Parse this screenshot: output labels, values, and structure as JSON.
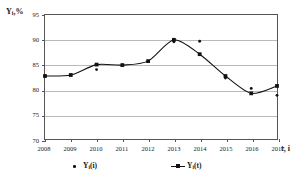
{
  "chart_data": {
    "type": "line",
    "title": "",
    "subtitle": "",
    "xlabel": "t, i",
    "ylabel": "Yᵢ,%",
    "ylabel_parts": {
      "base": "Y",
      "sub": "i",
      "suffix": ",%"
    },
    "xlabel_parts": {
      "base": "t, i"
    },
    "grid": true,
    "legend_position": "bottom",
    "x": [
      "2008",
      "2009",
      "2010",
      "2011",
      "2012",
      "2013",
      "2014",
      "2015",
      "2016",
      "2017"
    ],
    "categories": [
      "2008",
      "2009",
      "2010",
      "2011",
      "2012",
      "2013",
      "2014",
      "2015",
      "2016",
      "2017"
    ],
    "xlim": [
      2008,
      2017
    ],
    "ylim": [
      70,
      95
    ],
    "ytick_labels": [
      "95",
      "90",
      "85",
      "80",
      "75",
      "70"
    ],
    "yticks": [
      95,
      90,
      85,
      80,
      75,
      70
    ],
    "xtick_labels": [
      "2008",
      "2009",
      "2010",
      "2011",
      "2012",
      "2013",
      "2014",
      "2015",
      "2016",
      "2017"
    ],
    "series": [
      {
        "name": "Yᵢ(i)",
        "name_parts": {
          "base": "Y",
          "sub": "i",
          "suffix": "(i)"
        },
        "style": "scatter",
        "marker": "dot",
        "color": "#111111",
        "values": [
          82.7,
          82.9,
          84.0,
          84.9,
          85.6,
          89.6,
          89.7,
          82.3,
          80.2,
          78.8
        ]
      },
      {
        "name": "Yᵢ(t)",
        "name_parts": {
          "base": "Y",
          "sub": "i",
          "suffix": "(t)"
        },
        "style": "line-marker",
        "marker": "square",
        "color": "#111111",
        "values": [
          82.7,
          82.9,
          85.0,
          84.9,
          85.7,
          90.0,
          87.1,
          82.7,
          79.2,
          80.7
        ]
      }
    ]
  },
  "legend": {
    "entries": [
      {
        "label_base": "Y",
        "label_sub": "i",
        "label_suffix": "(i)"
      },
      {
        "label_base": "Y",
        "label_sub": "i",
        "label_suffix": "(t)"
      }
    ]
  }
}
